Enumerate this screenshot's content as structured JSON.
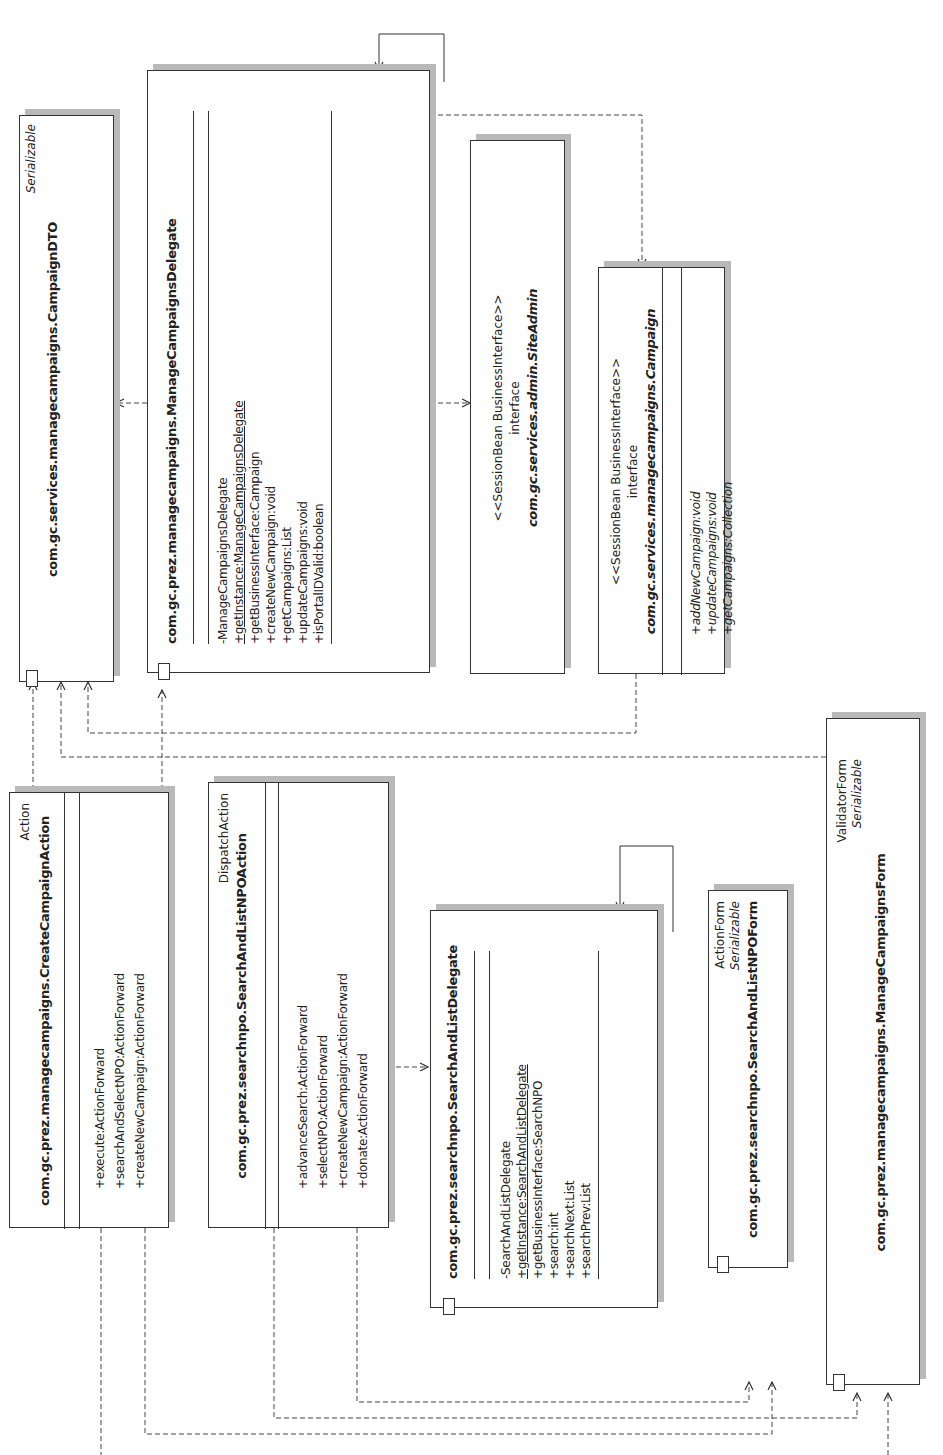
{
  "diagram": {
    "type": "UML class diagram (rotated 90° counter-clockwise)",
    "classes": {
      "campaign_dto": {
        "stereotype": "Serializable",
        "name": "com.gc.services.managecampaigns.CampaignDTO",
        "members": []
      },
      "manage_campaigns_delegate": {
        "stereotype": "",
        "name": "com.gc.prez.managecampaigns.ManageCampaignsDelegate",
        "members": [
          {
            "text": "-ManageCampaignsDelegate",
            "static": false
          },
          {
            "text": "+getInstance:ManageCampaignsDelegate",
            "static": true
          },
          {
            "text": "+getBusinessInterface:Campaign",
            "static": false
          },
          {
            "text": "+createNewCampaign:void",
            "static": false
          },
          {
            "text": "+getCampaigns:List",
            "static": false
          },
          {
            "text": "+updateCampaigns:void",
            "static": false
          },
          {
            "text": "+isPortalIDValid:boolean",
            "static": false
          }
        ]
      },
      "site_admin": {
        "stereotype": "<<SessionBean BusinessInterface>>",
        "kind": "interface",
        "name": "com.gc.services.admin.SiteAdmin",
        "members": []
      },
      "campaign": {
        "stereotype": "<<SessionBean BusinessInterface>>",
        "kind": "interface",
        "name": "com.gc.services.managecampaigns.Campaign",
        "members": [
          {
            "text": "+addNewCampaign:void"
          },
          {
            "text": "+updateCampaigns:void"
          },
          {
            "text": "+getCampaigns:Collection"
          }
        ]
      },
      "create_campaign_action": {
        "stereotype": "Action",
        "name": "com.gc.prez.managecampaigns.CreateCampaignAction",
        "members": [
          {
            "text": "+execute:ActionForward"
          },
          {
            "text": "+searchAndSelectNPO:ActionForward"
          },
          {
            "text": "+createNewCampaign:ActionForward"
          }
        ]
      },
      "search_and_list_npo_action": {
        "stereotype": "DispatchAction",
        "name": "com.gc.prez.searchnpo.SearchAndListNPOAction",
        "members": [
          {
            "text": "+advanceSearch:ActionForward"
          },
          {
            "text": "+selectNPO:ActionForward"
          },
          {
            "text": "+createNewCampaign:ActionForward"
          },
          {
            "text": "+donate:ActionForward"
          }
        ]
      },
      "search_and_list_delegate": {
        "stereotype": "",
        "name": "com.gc.prez.searchnpo.SearchAndListDelegate",
        "members": [
          {
            "text": "-SearchAndListDelegate",
            "static": false
          },
          {
            "text": "+getInstance:SearchAndListDelegate",
            "static": true
          },
          {
            "text": "+getBusinessInterface:SearchNPO",
            "static": false
          },
          {
            "text": "+search:int",
            "static": false
          },
          {
            "text": "+searchNext:List",
            "static": false
          },
          {
            "text": "+searchPrev:List",
            "static": false
          }
        ]
      },
      "search_and_list_npo_form": {
        "stereotype": "ActionForm",
        "stereotype2": "Serializable",
        "name": "com.gc.prez.searchnpo.SearchAndListNPOForm",
        "members": []
      },
      "manage_campaigns_form": {
        "stereotype": "ValidatorForm",
        "stereotype2": "Serializable",
        "name": "com.gc.prez.managecampaigns.ManageCampaignsForm",
        "members": []
      }
    }
  }
}
